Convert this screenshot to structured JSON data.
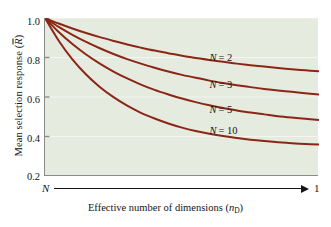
{
  "chart_data": {
    "type": "line",
    "title": "",
    "xlabel": "Effective number of dimensions (nD)",
    "xlabel_main": "Effective number of dimensions (",
    "xlabel_var": "n",
    "xlabel_sub": "D",
    "xlabel_close": ")",
    "ylabel_main": "Mean selection response (",
    "ylabel_var": "R",
    "ylabel_close": ")",
    "ylabel": "Mean selection response (R̄)",
    "x_axis_start_label": "N",
    "x_axis_end_label": "1",
    "xlim": [
      0,
      1
    ],
    "ylim": [
      0.2,
      1.0
    ],
    "grid": false,
    "background_color": "#e5ebdf",
    "curve_color": "#8b2617",
    "axis_color": "#8a8d86",
    "yticks": [
      "1.0",
      "0.8",
      "0.6",
      "0.4",
      "0.2"
    ],
    "ytick_values": [
      1.0,
      0.8,
      0.6,
      0.4,
      0.2
    ],
    "legend_position": "inline-right",
    "series": [
      {
        "name": "N = 2",
        "label_N": "N",
        "label_eq": "= 2",
        "asymptote": 0.68,
        "x": [
          0,
          0.05,
          0.1,
          0.15,
          0.2,
          0.25,
          0.3,
          0.35,
          0.4,
          0.45,
          0.5,
          0.55,
          0.6,
          0.65,
          0.7,
          0.75,
          0.8,
          0.85,
          0.9,
          0.95,
          1.0
        ],
        "values": [
          1.0,
          0.972,
          0.947,
          0.924,
          0.903,
          0.884,
          0.866,
          0.85,
          0.835,
          0.822,
          0.809,
          0.798,
          0.787,
          0.778,
          0.769,
          0.761,
          0.754,
          0.747,
          0.741,
          0.735,
          0.73
        ]
      },
      {
        "name": "N = 3",
        "label_N": "N",
        "label_eq": "= 3",
        "asymptote": 0.57,
        "x": [
          0,
          0.05,
          0.1,
          0.15,
          0.2,
          0.25,
          0.3,
          0.35,
          0.4,
          0.45,
          0.5,
          0.55,
          0.6,
          0.65,
          0.7,
          0.75,
          0.8,
          0.85,
          0.9,
          0.95,
          1.0
        ],
        "values": [
          1.0,
          0.955,
          0.915,
          0.879,
          0.847,
          0.818,
          0.792,
          0.769,
          0.748,
          0.729,
          0.712,
          0.697,
          0.683,
          0.671,
          0.66,
          0.65,
          0.641,
          0.633,
          0.626,
          0.619,
          0.613
        ]
      },
      {
        "name": "N = 5",
        "label_N": "N",
        "label_eq": "= 5",
        "asymptote": 0.455,
        "x": [
          0,
          0.05,
          0.1,
          0.15,
          0.2,
          0.25,
          0.3,
          0.35,
          0.4,
          0.45,
          0.5,
          0.55,
          0.6,
          0.65,
          0.7,
          0.75,
          0.8,
          0.85,
          0.9,
          0.95,
          1.0
        ],
        "values": [
          1.0,
          0.929,
          0.868,
          0.815,
          0.769,
          0.729,
          0.694,
          0.663,
          0.636,
          0.613,
          0.592,
          0.574,
          0.558,
          0.544,
          0.532,
          0.521,
          0.512,
          0.503,
          0.496,
          0.49,
          0.484
        ]
      },
      {
        "name": "N = 10",
        "label_N": "N",
        "label_eq": "= 10",
        "asymptote": 0.36,
        "x": [
          0,
          0.05,
          0.1,
          0.15,
          0.2,
          0.25,
          0.3,
          0.35,
          0.4,
          0.45,
          0.5,
          0.55,
          0.6,
          0.65,
          0.7,
          0.75,
          0.8,
          0.85,
          0.9,
          0.95,
          1.0
        ],
        "values": [
          1.0,
          0.885,
          0.791,
          0.714,
          0.651,
          0.599,
          0.556,
          0.52,
          0.491,
          0.466,
          0.445,
          0.428,
          0.414,
          0.402,
          0.392,
          0.384,
          0.377,
          0.371,
          0.366,
          0.362,
          0.359
        ]
      }
    ],
    "series_labels": [
      {
        "text": "N = 2",
        "x_pct": 0.6,
        "y_val": 0.795
      },
      {
        "text": "N = 3",
        "x_pct": 0.6,
        "y_val": 0.655
      },
      {
        "text": "N = 5",
        "x_pct": 0.6,
        "y_val": 0.53
      },
      {
        "text": "N = 10",
        "x_pct": 0.6,
        "y_val": 0.425
      }
    ]
  }
}
